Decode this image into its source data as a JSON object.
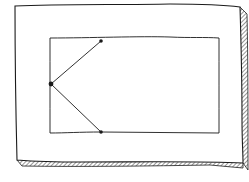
{
  "canvas": {
    "width": 249,
    "height": 182,
    "background": "#ffffff",
    "ink": "#1a1a1a"
  },
  "outer_panel": {
    "path": "M15,6 C60,4 120,5 170,4 C200,4 225,5 240,7 C241,40 242,80 242,120 C242,140 243,152 243,163 C200,161 140,162 80,162 C50,162 30,161 17,160 C16,120 15,70 15,6 Z"
  },
  "shadow": {
    "right_path": "M240,7 L247,14 C248,60 248,110 248,170 L243,163",
    "bottom_path": "M17,160 L22,166 C80,167 150,166 210,165 L243,168 L243,163"
  },
  "inner_rect": {
    "path": "M50,38 C90,38 140,36 170,37 C190,38 205,37 219,38 C219,70 219,100 219,133 C180,133 140,132 101,132 C80,132 65,133 50,133 C50,100 50,70 50,38 Z"
  },
  "nodes": [
    {
      "id": "left",
      "cx": 51,
      "cy": 84,
      "r": 2.4
    },
    {
      "id": "top",
      "cx": 101,
      "cy": 41,
      "r": 1.8
    },
    {
      "id": "bottom",
      "cx": 101,
      "cy": 132,
      "r": 1.8
    }
  ],
  "edges": [
    {
      "from": "left",
      "to": "top"
    },
    {
      "from": "left",
      "to": "bottom"
    }
  ]
}
